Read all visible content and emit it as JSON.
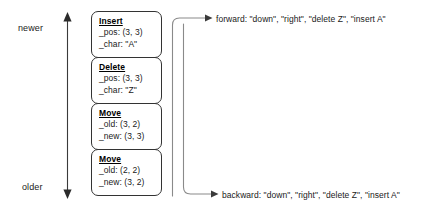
{
  "diagram": {
    "axis": {
      "newer_label": "newer",
      "older_label": "older",
      "arrow_name": "time-axis-double-arrow"
    },
    "stack": {
      "name": "operation-stack",
      "items": [
        {
          "id": "insert",
          "title": "Insert",
          "fields": [
            {
              "key": "_pos",
              "text": "_pos: (3, 3)"
            },
            {
              "key": "_char",
              "text": "_char: \"A\""
            }
          ]
        },
        {
          "id": "delete",
          "title": "Delete",
          "fields": [
            {
              "key": "_pos",
              "text": "_pos: (3, 3)"
            },
            {
              "key": "_char",
              "text": "_char: \"Z\""
            }
          ]
        },
        {
          "id": "move-1",
          "title": "Move",
          "fields": [
            {
              "key": "_old",
              "text": "_old: (3, 2)"
            },
            {
              "key": "_new",
              "text": "_new: (3, 3)"
            }
          ]
        },
        {
          "id": "move-2",
          "title": "Move",
          "fields": [
            {
              "key": "_old",
              "text": "_old: (2, 2)"
            },
            {
              "key": "_new",
              "text": "_new: (3, 2)"
            }
          ]
        }
      ]
    },
    "flows": [
      {
        "id": "forward",
        "label": "forward: \"down\", \"right\", \"delete Z\", \"insert A\""
      },
      {
        "id": "backward",
        "label": "backward: \"down\", \"right\", \"delete Z\", \"insert A\""
      }
    ],
    "colors": {
      "stroke": "#333333",
      "text": "#1a1a1a",
      "background": "#ffffff"
    }
  }
}
